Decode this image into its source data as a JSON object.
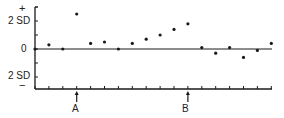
{
  "chart_data": {
    "type": "scatter",
    "title": "",
    "xlabel": "",
    "ylabel": "",
    "ylim": [
      -3,
      3
    ],
    "grid": false,
    "y_ticks": [
      {
        "value": 2,
        "label_top": "+",
        "label": "2 SD"
      },
      {
        "value": 0,
        "label": "0"
      },
      {
        "value": -2,
        "label": "2 SD",
        "label_bottom": "−"
      }
    ],
    "reference_line": {
      "value": 0
    },
    "x": [
      1,
      2,
      3,
      4,
      5,
      6,
      7,
      8,
      9,
      10,
      11,
      12,
      13,
      14,
      15,
      16,
      17,
      18
    ],
    "series": [
      {
        "name": "SD score",
        "values": [
          0.0,
          0.3,
          0.0,
          2.5,
          0.4,
          0.5,
          0.0,
          0.4,
          0.7,
          1.0,
          1.4,
          1.8,
          0.1,
          -0.3,
          0.1,
          -0.6,
          -0.1,
          0.4
        ]
      }
    ],
    "annotations": [
      {
        "label": "A",
        "x": 4,
        "type": "arrow-up"
      },
      {
        "label": "B",
        "x": 12,
        "type": "arrow-up"
      }
    ]
  },
  "axis": {
    "plus_sign": "+",
    "upper_label": "2 SD",
    "zero_label": "0",
    "lower_label": "2 SD",
    "minus_sign": "−"
  },
  "markers": {
    "a_label": "A",
    "b_label": "B"
  },
  "colors": {
    "ink": "#1a1a1a",
    "background": "#ffffff"
  }
}
